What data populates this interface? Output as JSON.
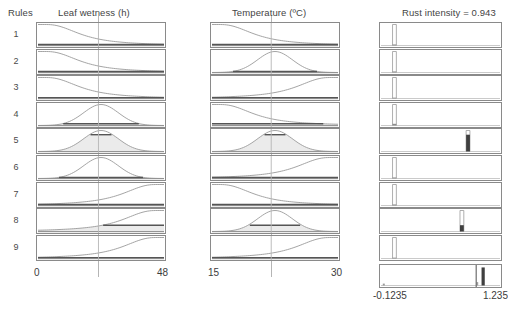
{
  "window": {
    "title": "Fuzzy Rule Viewer"
  },
  "headers": {
    "rules": "Rules",
    "input1": "Leaf wetness (h)",
    "input2": "Temperature (ºC)",
    "output": "Rust intensity = 0.943"
  },
  "rule_numbers": [
    "1",
    "2",
    "3",
    "4",
    "5",
    "6",
    "7",
    "8",
    "9"
  ],
  "axes": {
    "input1": {
      "min_label": "0",
      "max_label": "48",
      "min": 0,
      "max": 48,
      "input_value": 23
    },
    "input2": {
      "min_label": "15",
      "max_label": "30",
      "min": 15,
      "max": 30,
      "input_value": 22.5
    },
    "output": {
      "min_label": "-0.1235",
      "max_label": "1.235",
      "min": -0.1235,
      "max": 1.235,
      "defuzzified": 0.943
    }
  },
  "colors": {
    "curve": "#9a9a9a",
    "fill": "#ebebeb",
    "border": "#8a8a8a",
    "guide": "#b5b5b5",
    "clip": "#555555",
    "text": "#3a3a3a",
    "spike": "#3f3f3f"
  },
  "chart_data": {
    "type": "line",
    "title": "Rust intensity = 0.943",
    "subtitle": "Mamdani fuzzy inference rule viewer",
    "xlabel": "",
    "ylabel": "membership",
    "grid": false,
    "legend": "none",
    "columns": [
      {
        "name": "Leaf wetness (h)",
        "xlim": [
          0,
          48
        ],
        "input_value": 23
      },
      {
        "name": "Temperature (ºC)",
        "xlim": [
          15,
          30
        ],
        "input_value": 22.5
      },
      {
        "name": "Rust intensity",
        "xlim": [
          -0.1235,
          1.235
        ],
        "defuzzified": 0.943
      }
    ],
    "rules": [
      {
        "rule": 1,
        "antecedent1": "low",
        "antecedent2": "low",
        "consequent": "very low",
        "firing_strength": 0.05,
        "out_peak": 0.03
      },
      {
        "rule": 2,
        "antecedent1": "low",
        "antecedent2": "medium",
        "consequent": "very low",
        "firing_strength": 0.05,
        "out_peak": 0.03
      },
      {
        "rule": 3,
        "antecedent1": "low",
        "antecedent2": "high",
        "consequent": "very low",
        "firing_strength": 0.04,
        "out_peak": 0.03
      },
      {
        "rule": 4,
        "antecedent1": "medium",
        "antecedent2": "low",
        "consequent": "very low",
        "firing_strength": 0.08,
        "out_peak": 0.03
      },
      {
        "rule": 5,
        "antecedent1": "medium",
        "antecedent2": "medium",
        "consequent": "high",
        "firing_strength": 0.8,
        "out_peak": 0.87
      },
      {
        "rule": 6,
        "antecedent1": "medium",
        "antecedent2": "high",
        "consequent": "very low",
        "firing_strength": 0.05,
        "out_peak": 0.03
      },
      {
        "rule": 7,
        "antecedent1": "high",
        "antecedent2": "low",
        "consequent": "very low",
        "firing_strength": 0.05,
        "out_peak": 0.03
      },
      {
        "rule": 8,
        "antecedent1": "high",
        "antecedent2": "medium",
        "consequent": "high",
        "firing_strength": 0.3,
        "out_peak": 0.8
      },
      {
        "rule": 9,
        "antecedent1": "high",
        "antecedent2": "high",
        "consequent": "very low",
        "firing_strength": 0.04,
        "out_peak": 0.03
      }
    ],
    "aggregate": {
      "defuzzified": 0.943,
      "marker_position_fraction": 0.8
    }
  }
}
